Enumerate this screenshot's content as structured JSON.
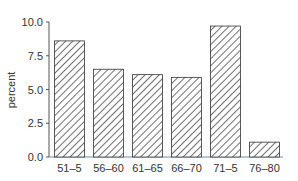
{
  "chart_data": {
    "type": "bar",
    "title": "",
    "xlabel": "",
    "ylabel": "percent",
    "categories": [
      "51–5",
      "56–60",
      "61–65",
      "66–70",
      "71–5",
      "76–80"
    ],
    "values": [
      8.6,
      6.5,
      6.1,
      5.9,
      9.7,
      1.1
    ],
    "ylim": [
      0,
      10
    ],
    "yticks": [
      "0.0",
      "2.5",
      "5.0",
      "7.5",
      "10.0"
    ],
    "grid": false,
    "legend": null,
    "bar_fill": "diagonal-hatch",
    "colors": {
      "hatch": "#333333",
      "axis": "#555555"
    }
  }
}
